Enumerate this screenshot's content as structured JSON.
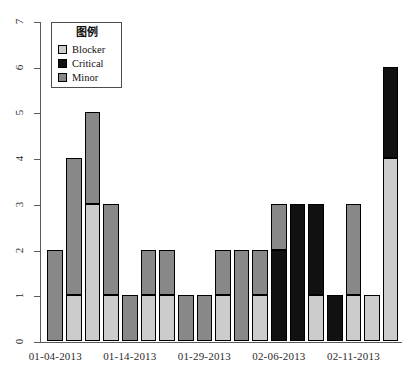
{
  "chart_data": {
    "type": "bar",
    "stacked": true,
    "title": "",
    "xlabel": "",
    "ylabel": "",
    "ylim": [
      0,
      7
    ],
    "yticks": [
      0,
      1,
      2,
      3,
      4,
      5,
      6,
      7
    ],
    "grid": false,
    "legend": {
      "title": "图例",
      "position": "top-left",
      "entries": [
        {
          "name": "Blocker",
          "color": "#cccccc"
        },
        {
          "name": "Critical",
          "color": "#111111"
        },
        {
          "name": "Minor",
          "color": "#888888"
        }
      ]
    },
    "categories": [
      "01-04-2013",
      "",
      "",
      "",
      "01-14-2013",
      "",
      "",
      "",
      "01-29-2013",
      "",
      "",
      "",
      "02-06-2013",
      "",
      "",
      "",
      "02-11-2013",
      "",
      ""
    ],
    "xtick_labels": [
      "01-04-2013",
      "01-14-2013",
      "01-29-2013",
      "02-06-2013",
      "02-11-2013"
    ],
    "xtick_bar_index": [
      0,
      4,
      8,
      12,
      16
    ],
    "series": [
      {
        "name": "Blocker",
        "color": "#cccccc",
        "values": [
          0,
          1,
          3,
          1,
          0,
          1,
          1,
          0,
          0,
          1,
          0,
          1,
          0,
          0,
          1,
          0,
          1,
          1,
          4
        ]
      },
      {
        "name": "Critical",
        "color": "#111111",
        "values": [
          0,
          0,
          0,
          0,
          0,
          0,
          0,
          0,
          0,
          0,
          0,
          0,
          2,
          3,
          2,
          1,
          0,
          0,
          2
        ]
      },
      {
        "name": "Minor",
        "color": "#888888",
        "values": [
          2,
          3,
          2,
          2,
          1,
          1,
          1,
          1,
          1,
          1,
          2,
          1,
          1,
          0,
          0,
          0,
          2,
          0,
          0
        ]
      }
    ],
    "bar_totals": [
      2,
      4,
      5,
      3,
      1,
      2,
      2,
      1,
      1,
      2,
      2,
      2,
      3,
      3,
      3,
      1,
      3,
      1,
      6
    ]
  }
}
